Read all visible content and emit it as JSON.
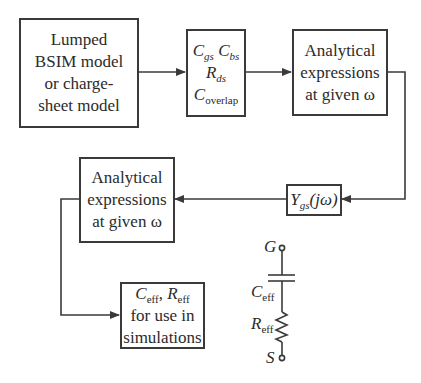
{
  "diagram": {
    "boxes": {
      "lumped": {
        "lines": [
          "Lumped",
          "BSIM model",
          "or charge-",
          "sheet model"
        ]
      },
      "params": {
        "cgs": {
          "main": "C",
          "sub": "gs"
        },
        "cbs": {
          "main": "C",
          "sub": "bs"
        },
        "rds": {
          "main": "R",
          "sub": "ds"
        },
        "coverlap": {
          "main": "C",
          "sub": "overlap"
        }
      },
      "analytical_top": {
        "lines": [
          "Analytical",
          "expressions",
          "at given ω"
        ]
      },
      "ygs": {
        "main": "Y",
        "sub": "gs",
        "arg": "(jω)"
      },
      "analytical_bottom": {
        "lines": [
          "Analytical",
          "expressions",
          "at given ω"
        ]
      },
      "result": {
        "ceff": {
          "main": "C",
          "sub": "eff"
        },
        "sep": ", ",
        "reff": {
          "main": "R",
          "sub": "eff"
        },
        "lines": [
          "for use in",
          "simulations"
        ]
      }
    },
    "circuit": {
      "gate_label": "G",
      "source_label": "S",
      "cap_label": {
        "main": "C",
        "sub": "eff"
      },
      "res_label": {
        "main": "R",
        "sub": "eff"
      }
    },
    "colors": {
      "stroke": "#3a3a3a",
      "text": "#2b2b2b",
      "background": "#ffffff"
    }
  }
}
